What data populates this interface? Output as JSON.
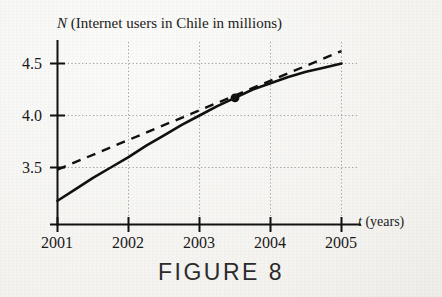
{
  "figure": {
    "caption": "FIGURE 8"
  },
  "chart_data": {
    "type": "line",
    "title": "N (Internet users in Chile in millions)",
    "title_variable": "N",
    "title_rest": " (Internet users in Chile in millions)",
    "xlabel": "t (years)",
    "xlabel_variable": "t",
    "xlabel_rest": " (years)",
    "ylabel": "N",
    "xlim": [
      2001,
      2005
    ],
    "ylim": [
      3.18,
      4.65
    ],
    "grid": true,
    "grid_style": "dotted",
    "legend": "none",
    "xticks": [
      2001,
      2002,
      2003,
      2004,
      2005
    ],
    "xticklabels": [
      "2001",
      "2002",
      "2003",
      "2004",
      "2005"
    ],
    "yticks": [
      3.5,
      4.0,
      4.5
    ],
    "yticklabels": [
      "3.5",
      "4.0",
      "4.5"
    ],
    "series": [
      {
        "name": "N(t) Internet users curve",
        "style": "solid",
        "color": "#111111",
        "x": [
          2001.0,
          2001.25,
          2001.5,
          2001.75,
          2002.0,
          2002.25,
          2002.5,
          2002.75,
          2003.0,
          2003.25,
          2003.5,
          2003.75,
          2004.0,
          2004.25,
          2004.5,
          2004.75,
          2005.0
        ],
        "y": [
          3.18,
          3.29,
          3.4,
          3.5,
          3.6,
          3.71,
          3.81,
          3.91,
          4.0,
          4.09,
          4.17,
          4.25,
          4.31,
          4.37,
          4.42,
          4.46,
          4.5
        ]
      },
      {
        "name": "tangent line at t = 2003.5",
        "style": "dashed",
        "color": "#111111",
        "x": [
          2001.0,
          2005.0
        ],
        "y": [
          3.48,
          4.62
        ]
      }
    ],
    "annotations": [
      {
        "name": "tangent-point",
        "label": "point of tangency",
        "x": 2003.5,
        "y": 4.17,
        "marker": "filled-circle"
      }
    ]
  }
}
